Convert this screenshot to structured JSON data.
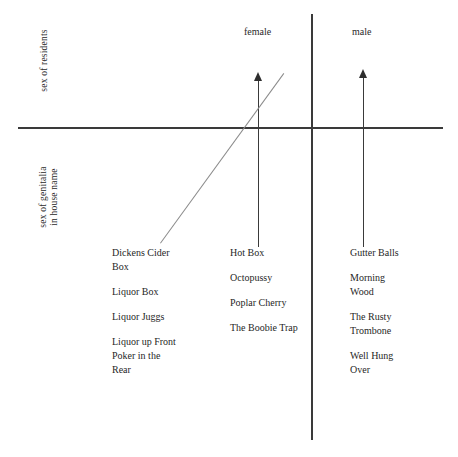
{
  "chart_data": {
    "type": "scatter",
    "title": "",
    "xlabel": "sex of residents",
    "ylabel": "sex of genitalia in house name",
    "grid": false,
    "legend": null,
    "axes": {
      "x_axis_label": "sex of residents",
      "y_axis_label_line1": "sex of genitalia",
      "y_axis_label_line2": "in house name"
    },
    "categories": [
      "female",
      "male"
    ],
    "series": [
      {
        "name": "female",
        "items": [
          "Hot Box",
          "Octopussy",
          "Poplar Cherry",
          "The Boobie Trap"
        ]
      },
      {
        "name": "male",
        "items": [
          "Gutter Balls",
          "Morning Wood",
          "The Rusty Trombone",
          "Well Hung Over"
        ]
      }
    ],
    "unclassified_items": [
      "Dickens Cider Box",
      "Liquor Box",
      "Liquor Juggs",
      "Liquor up Front Poker in the Rear"
    ],
    "annotations": [
      "upward arrow above female column",
      "upward arrow above male column",
      "diagonal trend line rising left to right through origin"
    ]
  },
  "axis_titles": {
    "upper": "sex of residents",
    "lower_line1": "sex of genitalia",
    "lower_line2": "in house name"
  },
  "column_headers": {
    "female": "female",
    "male": "male"
  },
  "columns": {
    "left": [
      {
        "line1": "Dickens Cider",
        "line2": "Box"
      },
      {
        "line1": "Liquor Box",
        "line2": ""
      },
      {
        "line1": "Liquor Juggs",
        "line2": ""
      },
      {
        "line1": "Liquor up Front",
        "line2": "Poker in the",
        "line3": "Rear"
      }
    ],
    "middle": [
      {
        "line1": "Hot Box",
        "line2": ""
      },
      {
        "line1": "Octopussy",
        "line2": ""
      },
      {
        "line1": "Poplar Cherry",
        "line2": ""
      },
      {
        "line1": "The Boobie Trap",
        "line2": ""
      }
    ],
    "right": [
      {
        "line1": "Gutter Balls",
        "line2": ""
      },
      {
        "line1": "Morning",
        "line2": "Wood"
      },
      {
        "line1": "The Rusty",
        "line2": "Trombone"
      },
      {
        "line1": "Well Hung",
        "line2": "Over"
      }
    ]
  },
  "colors": {
    "axis": "#3a3a3a",
    "diagonal": "#8a8a8a",
    "text": "#1f1f1f",
    "background": "#ffffff"
  }
}
